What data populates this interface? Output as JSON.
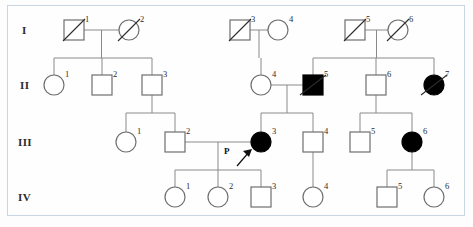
{
  "figure": {
    "type": "pedigree-chart",
    "title": "",
    "frame_color": "#c9d6e2",
    "line_color": "#8a8a8a",
    "affected_color": "#000000",
    "unaffected_color": "#ffffff",
    "proband_marker": "P"
  },
  "generation_labels": [
    {
      "id": "gen-I",
      "text": "I"
    },
    {
      "id": "gen-II",
      "text": "II"
    },
    {
      "id": "gen-III",
      "text": "III"
    },
    {
      "id": "gen-IV",
      "text": "IV"
    }
  ],
  "legend_semantics": {
    "square": "male",
    "circle": "female",
    "filled": "affected",
    "open": "unaffected",
    "slash": "deceased",
    "arrow_P": "proband"
  },
  "individuals": [
    {
      "key": "I-1",
      "generation": "I",
      "number": "1",
      "sex": "male",
      "affected": false,
      "deceased": true,
      "proband": false,
      "cx": 74,
      "cy": 30
    },
    {
      "key": "I-2",
      "generation": "I",
      "number": "2",
      "sex": "female",
      "affected": false,
      "deceased": true,
      "proband": false,
      "cx": 129,
      "cy": 30
    },
    {
      "key": "I-3",
      "generation": "I",
      "number": "3",
      "sex": "male",
      "affected": false,
      "deceased": true,
      "proband": false,
      "cx": 240,
      "cy": 30
    },
    {
      "key": "I-4",
      "generation": "I",
      "number": "4",
      "sex": "female",
      "affected": false,
      "deceased": false,
      "proband": false,
      "cx": 278,
      "cy": 30
    },
    {
      "key": "I-5",
      "generation": "I",
      "number": "5",
      "sex": "male",
      "affected": false,
      "deceased": true,
      "proband": false,
      "cx": 355,
      "cy": 30
    },
    {
      "key": "I-6",
      "generation": "I",
      "number": "6",
      "sex": "female",
      "affected": false,
      "deceased": true,
      "proband": false,
      "cx": 398,
      "cy": 30
    },
    {
      "key": "II-1",
      "generation": "II",
      "number": "1",
      "sex": "female",
      "affected": false,
      "deceased": false,
      "proband": false,
      "cx": 54,
      "cy": 85
    },
    {
      "key": "II-2",
      "generation": "II",
      "number": "2",
      "sex": "male",
      "affected": false,
      "deceased": false,
      "proband": false,
      "cx": 102,
      "cy": 85
    },
    {
      "key": "II-3",
      "generation": "II",
      "number": "3",
      "sex": "male",
      "affected": false,
      "deceased": false,
      "proband": false,
      "cx": 152,
      "cy": 85
    },
    {
      "key": "II-4",
      "generation": "II",
      "number": "4",
      "sex": "female",
      "affected": false,
      "deceased": false,
      "proband": false,
      "cx": 261,
      "cy": 85
    },
    {
      "key": "II-5",
      "generation": "II",
      "number": "5",
      "sex": "male",
      "affected": true,
      "deceased": true,
      "proband": false,
      "cx": 313,
      "cy": 85
    },
    {
      "key": "II-6",
      "generation": "II",
      "number": "6",
      "sex": "male",
      "affected": false,
      "deceased": false,
      "proband": false,
      "cx": 376,
      "cy": 85
    },
    {
      "key": "II-7",
      "generation": "II",
      "number": "7",
      "sex": "female",
      "affected": true,
      "deceased": true,
      "proband": false,
      "cx": 434,
      "cy": 85
    },
    {
      "key": "III-1",
      "generation": "III",
      "number": "1",
      "sex": "female",
      "affected": false,
      "deceased": false,
      "proband": false,
      "cx": 126,
      "cy": 142
    },
    {
      "key": "III-2",
      "generation": "III",
      "number": "2",
      "sex": "male",
      "affected": false,
      "deceased": false,
      "proband": false,
      "cx": 175,
      "cy": 142
    },
    {
      "key": "III-3",
      "generation": "III",
      "number": "3",
      "sex": "female",
      "affected": true,
      "deceased": false,
      "proband": true,
      "cx": 261,
      "cy": 142
    },
    {
      "key": "III-4",
      "generation": "III",
      "number": "4",
      "sex": "male",
      "affected": false,
      "deceased": false,
      "proband": false,
      "cx": 313,
      "cy": 142
    },
    {
      "key": "III-5",
      "generation": "III",
      "number": "5",
      "sex": "male",
      "affected": false,
      "deceased": false,
      "proband": false,
      "cx": 360,
      "cy": 142
    },
    {
      "key": "III-6",
      "generation": "III",
      "number": "6",
      "sex": "female",
      "affected": true,
      "deceased": false,
      "proband": false,
      "cx": 412,
      "cy": 142
    },
    {
      "key": "IV-1",
      "generation": "IV",
      "number": "1",
      "sex": "female",
      "affected": false,
      "deceased": false,
      "proband": false,
      "cx": 175,
      "cy": 197
    },
    {
      "key": "IV-2",
      "generation": "IV",
      "number": "2",
      "sex": "female",
      "affected": false,
      "deceased": false,
      "proband": false,
      "cx": 218,
      "cy": 197
    },
    {
      "key": "IV-3",
      "generation": "IV",
      "number": "3",
      "sex": "male",
      "affected": false,
      "deceased": false,
      "proband": false,
      "cx": 261,
      "cy": 197
    },
    {
      "key": "IV-4",
      "generation": "IV",
      "number": "4",
      "sex": "female",
      "affected": false,
      "deceased": false,
      "proband": false,
      "cx": 313,
      "cy": 197
    },
    {
      "key": "IV-5",
      "generation": "IV",
      "number": "5",
      "sex": "male",
      "affected": false,
      "deceased": false,
      "proband": false,
      "cx": 387,
      "cy": 197
    },
    {
      "key": "IV-6",
      "generation": "IV",
      "number": "6",
      "sex": "female",
      "affected": false,
      "deceased": false,
      "proband": false,
      "cx": 434,
      "cy": 197
    }
  ],
  "matings": [
    {
      "key": "I-1xI-2",
      "partners": [
        "I-1",
        "I-2"
      ],
      "children": [
        "II-1",
        "II-2",
        "II-3"
      ]
    },
    {
      "key": "I-3xI-4",
      "partners": [
        "I-3",
        "I-4"
      ],
      "children": [
        "II-4"
      ]
    },
    {
      "key": "I-5xI-6",
      "partners": [
        "I-5",
        "I-6"
      ],
      "children": [
        "II-5",
        "II-6",
        "II-7"
      ]
    },
    {
      "key": "II-3",
      "partners": [
        "II-3"
      ],
      "children": [
        "III-1",
        "III-2"
      ]
    },
    {
      "key": "II-4xII-5",
      "partners": [
        "II-4",
        "II-5"
      ],
      "children": [
        "III-3",
        "III-4"
      ]
    },
    {
      "key": "II-6",
      "partners": [
        "II-6"
      ],
      "children": [
        "III-5",
        "III-6"
      ]
    },
    {
      "key": "III-2xIII-3",
      "partners": [
        "III-2",
        "III-3"
      ],
      "children": [
        "IV-1",
        "IV-2",
        "IV-3"
      ]
    },
    {
      "key": "III-4",
      "partners": [
        "III-4"
      ],
      "children": [
        "IV-4"
      ]
    },
    {
      "key": "III-6",
      "partners": [
        "III-6"
      ],
      "children": [
        "IV-5",
        "IV-6"
      ]
    }
  ]
}
